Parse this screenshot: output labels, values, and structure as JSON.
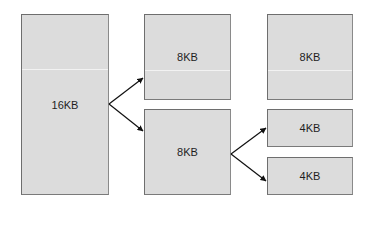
{
  "diagram": {
    "type": "memory-block-split",
    "colors": {
      "box_fill": "#dcdcdc",
      "box_border": "#6e6e6e",
      "arrow": "#111111",
      "background": "#ffffff"
    },
    "blocks": [
      {
        "id": "block-16kb",
        "label": "16KB",
        "column": 0
      },
      {
        "id": "block-8kb-a",
        "label": "8KB",
        "column": 1
      },
      {
        "id": "block-8kb-b",
        "label": "8KB",
        "column": 1
      },
      {
        "id": "block-8kb-c",
        "label": "8KB",
        "column": 2
      },
      {
        "id": "block-4kb-a",
        "label": "4KB",
        "column": 2
      },
      {
        "id": "block-4kb-b",
        "label": "4KB",
        "column": 2
      }
    ],
    "edges": [
      {
        "from": "block-16kb",
        "to": "block-8kb-a"
      },
      {
        "from": "block-16kb",
        "to": "block-8kb-b"
      },
      {
        "from": "block-8kb-b",
        "to": "block-4kb-a"
      },
      {
        "from": "block-8kb-b",
        "to": "block-4kb-b"
      }
    ]
  }
}
